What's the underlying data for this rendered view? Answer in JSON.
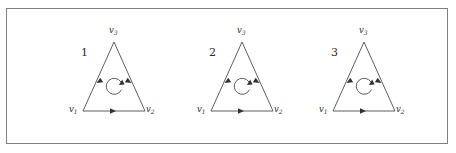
{
  "figure": {
    "background_color": "#ffffff",
    "frame_color": "#808080",
    "line_color": "#4d4d4d",
    "text_color": "#2b2b2b",
    "width": 456,
    "height": 153
  },
  "panels": [
    {
      "number": "1",
      "left": 60,
      "number_x": 14,
      "number_y": 38,
      "vertices": {
        "v1": {
          "name": "v",
          "sub": "1",
          "x": 2,
          "y": 96
        },
        "v2": {
          "name": "v",
          "sub": "2",
          "x": 79,
          "y": 96
        },
        "v3": {
          "name": "v",
          "sub": "3",
          "x": 42,
          "y": 17
        }
      },
      "geometry": {
        "apex_x": 47,
        "apex_y": 33,
        "base_left_x": 16,
        "base_right_x": 78,
        "base_y": 102,
        "loop_cx": 47,
        "loop_cy": 76,
        "loop_r": 8
      },
      "edges": [
        {
          "from": "v1",
          "to": "v2",
          "direction": "right",
          "label": "bottom-edge"
        },
        {
          "from": "v2",
          "to": "v3",
          "direction": "up-right",
          "label": "right-edge"
        },
        {
          "from": "v3",
          "to": "v1",
          "direction": "down-left",
          "label": "left-edge"
        }
      ],
      "loop": {
        "orientation": "counterclockwise",
        "label": "orientation-loop"
      }
    },
    {
      "number": "2",
      "left": 188,
      "number_x": 14,
      "number_y": 38,
      "vertices": {
        "v1": {
          "name": "v",
          "sub": "1",
          "x": 2,
          "y": 96
        },
        "v2": {
          "name": "v",
          "sub": "2",
          "x": 79,
          "y": 96
        },
        "v3": {
          "name": "v",
          "sub": "3",
          "x": 42,
          "y": 17
        }
      },
      "geometry": {
        "apex_x": 47,
        "apex_y": 33,
        "base_left_x": 16,
        "base_right_x": 78,
        "base_y": 102,
        "loop_cx": 47,
        "loop_cy": 76,
        "loop_r": 8
      },
      "edges": [
        {
          "from": "v1",
          "to": "v2",
          "direction": "right",
          "label": "bottom-edge"
        },
        {
          "from": "v2",
          "to": "v3",
          "direction": "up-right",
          "label": "right-edge"
        },
        {
          "from": "v3",
          "to": "v1",
          "direction": "down-left",
          "label": "left-edge"
        }
      ],
      "loop": {
        "orientation": "counterclockwise",
        "label": "orientation-loop"
      }
    },
    {
      "number": "3",
      "left": 310,
      "number_x": 14,
      "number_y": 38,
      "vertices": {
        "v1": {
          "name": "v",
          "sub": "1",
          "x": 2,
          "y": 96
        },
        "v2": {
          "name": "v",
          "sub": "2",
          "x": 79,
          "y": 96
        },
        "v3": {
          "name": "v",
          "sub": "3",
          "x": 42,
          "y": 17
        }
      },
      "geometry": {
        "apex_x": 47,
        "apex_y": 33,
        "base_left_x": 16,
        "base_right_x": 78,
        "base_y": 102,
        "loop_cx": 47,
        "loop_cy": 76,
        "loop_r": 8
      },
      "edges": [
        {
          "from": "v1",
          "to": "v2",
          "direction": "right",
          "label": "bottom-edge"
        },
        {
          "from": "v2",
          "to": "v3",
          "direction": "up-right",
          "label": "right-edge"
        },
        {
          "from": "v3",
          "to": "v1",
          "direction": "down-left",
          "label": "left-edge"
        }
      ],
      "loop": {
        "orientation": "counterclockwise",
        "label": "orientation-loop"
      }
    }
  ]
}
